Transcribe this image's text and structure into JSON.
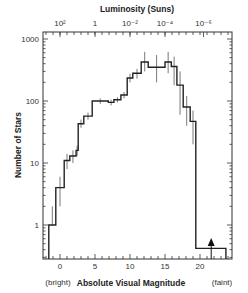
{
  "chart_data": {
    "type": "bar",
    "subtype": "step-histogram",
    "title": "",
    "xlabel": "Absolute Visual Magnitude",
    "ylabel": "Number of Stars",
    "top_xlabel": "Luminosity (Suns)",
    "x_endpoints": {
      "left": "(bright)",
      "right": "(faint)"
    },
    "xlim": [
      -2.4,
      24.6
    ],
    "ylim": [
      0.25,
      1300
    ],
    "yscale": "log",
    "x_ticks": [
      0,
      5,
      10,
      15,
      20
    ],
    "x_tick_labels": [
      "0",
      "5",
      "10",
      "15",
      "20"
    ],
    "y_ticks": [
      1,
      10,
      100,
      1000
    ],
    "y_tick_labels": [
      "1",
      "10",
      "100",
      "1000"
    ],
    "top_ticks": [
      {
        "magnitude": 0.0,
        "label": "10²"
      },
      {
        "magnitude": 5.0,
        "label": "1"
      },
      {
        "magnitude": 10.0,
        "label": "10⁻²"
      },
      {
        "magnitude": 15.0,
        "label": "10⁻⁴"
      },
      {
        "magnitude": 20.5,
        "label": "10⁻⁶"
      }
    ],
    "grid": false,
    "legend": null,
    "bins": [
      {
        "from": -1.6,
        "to": -0.6,
        "count": 1,
        "err_low": 1,
        "err_high": 2
      },
      {
        "from": -0.6,
        "to": 0.6,
        "count": 4,
        "err_low": 2,
        "err_high": 6
      },
      {
        "from": 0.6,
        "to": 1.4,
        "count": 11,
        "err_low": 8,
        "err_high": 14
      },
      {
        "from": 1.4,
        "to": 2.3,
        "count": 13,
        "err_low": 10,
        "err_high": 16
      },
      {
        "from": 2.3,
        "to": 2.6,
        "count": 16,
        "err_low": 13,
        "err_high": 19
      },
      {
        "from": 2.6,
        "to": 3.4,
        "count": 43,
        "err_low": 37,
        "err_high": 50
      },
      {
        "from": 3.4,
        "to": 4.6,
        "count": 57,
        "err_low": 50,
        "err_high": 65
      },
      {
        "from": 4.6,
        "to": 6.9,
        "count": 100,
        "err_low": 90,
        "err_high": 110
      },
      {
        "from": 6.9,
        "to": 7.7,
        "count": 95,
        "err_low": 85,
        "err_high": 105
      },
      {
        "from": 7.7,
        "to": 8.7,
        "count": 105,
        "err_low": 95,
        "err_high": 115
      },
      {
        "from": 8.7,
        "to": 9.6,
        "count": 125,
        "err_low": 110,
        "err_high": 140
      },
      {
        "from": 9.6,
        "to": 10.4,
        "count": 235,
        "err_low": 200,
        "err_high": 275
      },
      {
        "from": 10.4,
        "to": 11.6,
        "count": 280,
        "err_low": 230,
        "err_high": 330
      },
      {
        "from": 11.6,
        "to": 12.6,
        "count": 425,
        "err_low": 300,
        "err_high": 620
      },
      {
        "from": 12.6,
        "to": 15.0,
        "count": 350,
        "err_low": 200,
        "err_high": 550
      },
      {
        "from": 15.0,
        "to": 15.9,
        "count": 425,
        "err_low": 280,
        "err_high": 620
      },
      {
        "from": 15.9,
        "to": 16.7,
        "count": 360,
        "err_low": 180,
        "err_high": 520
      },
      {
        "from": 16.7,
        "to": 17.6,
        "count": 180,
        "err_low": 60,
        "err_high": 300
      },
      {
        "from": 17.6,
        "to": 18.6,
        "count": 80,
        "err_low": 40,
        "err_high": 120
      },
      {
        "from": 18.6,
        "to": 19.4,
        "count": 47,
        "err_low": 20,
        "err_high": 70
      },
      {
        "from": 19.4,
        "to": 23.7,
        "count": 0.42,
        "err_low": null,
        "err_high": null
      }
    ],
    "annotations": [
      {
        "type": "upper-limit-arrow",
        "magnitude": 21.6,
        "direction": "up"
      }
    ]
  },
  "labels": {
    "ylabel": "Number of Stars",
    "xlabel": "Absolute Visual Magnitude",
    "top_xlabel": "Luminosity (Suns)",
    "bright": "(bright)",
    "faint": "(faint)"
  }
}
